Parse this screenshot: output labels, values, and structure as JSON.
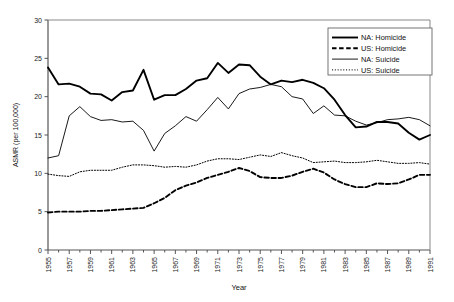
{
  "chart_data": {
    "type": "line",
    "title": "",
    "xlabel": "Year",
    "ylabel": "ASMR (per 100,000)",
    "xlim": [
      1955,
      1991
    ],
    "ylim": [
      0,
      30
    ],
    "yticks": [
      0,
      5,
      10,
      15,
      20,
      25,
      30
    ],
    "xticks": [
      1955,
      1957,
      1959,
      1961,
      1963,
      1965,
      1967,
      1969,
      1971,
      1973,
      1975,
      1977,
      1979,
      1981,
      1983,
      1985,
      1987,
      1989,
      1991
    ],
    "x": [
      1955,
      1956,
      1957,
      1958,
      1959,
      1960,
      1961,
      1962,
      1963,
      1964,
      1965,
      1966,
      1967,
      1968,
      1969,
      1970,
      1971,
      1972,
      1973,
      1974,
      1975,
      1976,
      1977,
      1978,
      1979,
      1980,
      1981,
      1982,
      1983,
      1984,
      1985,
      1986,
      1987,
      1988,
      1989,
      1990,
      1991
    ],
    "grid": false,
    "legend_position": "top-right",
    "series": [
      {
        "name": "NA: Homicide",
        "style": "thick-solid",
        "color": "#000000",
        "values": [
          23.8,
          21.6,
          21.7,
          21.3,
          20.4,
          20.3,
          19.5,
          20.6,
          20.8,
          23.5,
          19.6,
          20.2,
          20.2,
          21.0,
          22.1,
          22.4,
          24.4,
          23.1,
          24.2,
          24.1,
          22.6,
          21.6,
          22.1,
          21.9,
          22.2,
          21.8,
          21.1,
          19.6,
          17.6,
          16.0,
          16.1,
          16.7,
          16.7,
          16.5,
          15.3,
          14.4,
          15.0
        ]
      },
      {
        "name": "US: Homicide",
        "style": "thick-dashed",
        "color": "#000000",
        "values": [
          4.9,
          5.0,
          5.0,
          5.0,
          5.1,
          5.1,
          5.2,
          5.3,
          5.4,
          5.5,
          6.1,
          6.8,
          7.8,
          8.4,
          8.8,
          9.4,
          9.8,
          10.2,
          10.7,
          10.3,
          9.5,
          9.4,
          9.4,
          9.7,
          10.2,
          10.6,
          10.1,
          9.2,
          8.6,
          8.2,
          8.2,
          8.7,
          8.6,
          8.7,
          9.2,
          9.8,
          9.8
        ]
      },
      {
        "name": "NA: Suicide",
        "style": "thin-solid",
        "color": "#000000",
        "values": [
          12.0,
          12.3,
          17.5,
          18.7,
          17.4,
          16.9,
          17.0,
          16.7,
          16.8,
          15.6,
          12.9,
          15.2,
          16.2,
          17.4,
          16.8,
          18.3,
          19.9,
          18.4,
          20.4,
          21.0,
          21.2,
          21.6,
          21.3,
          20.0,
          19.7,
          17.8,
          18.8,
          17.6,
          17.5,
          16.8,
          16.3,
          16.6,
          17.0,
          17.1,
          17.3,
          17.0,
          16.2
        ]
      },
      {
        "name": "US: Suicide",
        "style": "dotted",
        "color": "#000000",
        "values": [
          9.9,
          9.7,
          9.6,
          10.2,
          10.4,
          10.4,
          10.4,
          10.8,
          11.1,
          11.1,
          11.0,
          10.8,
          10.9,
          10.8,
          11.1,
          11.6,
          11.9,
          11.9,
          11.8,
          12.1,
          12.4,
          12.2,
          12.7,
          12.3,
          12.0,
          11.4,
          11.5,
          11.6,
          11.4,
          11.4,
          11.5,
          11.7,
          11.5,
          11.3,
          11.3,
          11.4,
          11.2
        ]
      }
    ]
  },
  "axes": {
    "y_tick_labels": [
      "0",
      "5",
      "10",
      "15",
      "20",
      "25",
      "30"
    ],
    "x_tick_labels": [
      "1955",
      "1957",
      "1959",
      "1961",
      "1963",
      "1965",
      "1967",
      "1969",
      "1971",
      "1973",
      "1975",
      "1977",
      "1979",
      "1981",
      "1983",
      "1985",
      "1987",
      "1989",
      "1991"
    ],
    "y_axis_title": "ASMR (per 100,000)",
    "x_axis_title": "Year"
  },
  "legend": {
    "entries": [
      {
        "label": "NA: Homicide",
        "style": "thick-solid"
      },
      {
        "label": "US: Homicide",
        "style": "thick-dashed"
      },
      {
        "label": "NA: Suicide",
        "style": "thin-solid"
      },
      {
        "label": "US: Suicide",
        "style": "dotted"
      }
    ]
  }
}
